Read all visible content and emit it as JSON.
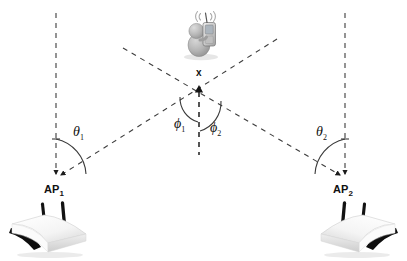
{
  "figure": {
    "kind": "wireless-localization-geometry-diagram",
    "background_color": "#ffffff",
    "line_color": "#3a3a3a",
    "label_color": "#111111",
    "width": 407,
    "height": 261
  },
  "nodes": {
    "target": {
      "label": "x",
      "icon": "person-with-device-icon",
      "x": 199,
      "y": 88
    },
    "ap1": {
      "label": "AP",
      "subscript": "1",
      "icon": "wifi-router-icon",
      "x": 56,
      "y": 180
    },
    "ap2": {
      "label": "AP",
      "subscript": "2",
      "icon": "wifi-router-icon",
      "x": 345,
      "y": 180
    }
  },
  "angles": [
    {
      "name": "theta-1",
      "label": "θ",
      "subscript": "1",
      "x": 74,
      "y": 120
    },
    {
      "name": "phi-1",
      "label": "ϕ",
      "subscript": "1",
      "x": 176,
      "y": 116
    },
    {
      "name": "phi-2",
      "label": "ϕ",
      "subscript": "2",
      "x": 211,
      "y": 120
    },
    {
      "name": "theta-2",
      "label": "θ",
      "subscript": "2",
      "x": 318,
      "y": 120
    }
  ],
  "lines": {
    "ap1_vertical": {
      "x1": 56,
      "y1": 13,
      "x2": 56,
      "y2": 178,
      "style": "dashed",
      "arrow_end": true
    },
    "ap2_vertical": {
      "x1": 345,
      "y1": 13,
      "x2": 345,
      "y2": 178,
      "style": "dashed",
      "arrow_end": true
    },
    "target_vertical": {
      "x1": 199,
      "y1": 90,
      "x2": 199,
      "y2": 154,
      "style": "dashed",
      "arrow_end": false
    },
    "ray_ap1": {
      "x1": 275,
      "y1": 40,
      "x2": 62,
      "y2": 176,
      "style": "dashed",
      "arrow_end": true
    },
    "ray_ap2": {
      "x1": 124,
      "y1": 47,
      "x2": 340,
      "y2": 176,
      "style": "dashed",
      "arrow_end": true
    }
  }
}
